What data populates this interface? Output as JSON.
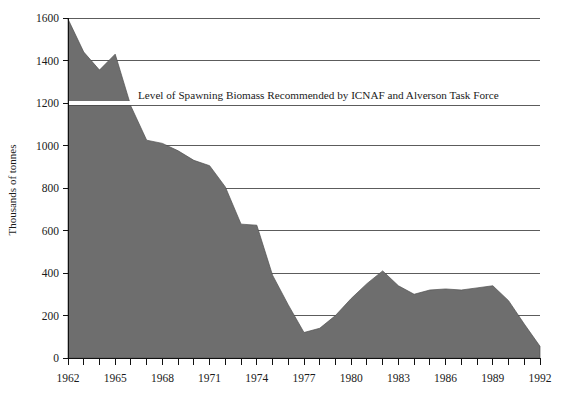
{
  "chart_data": {
    "type": "area",
    "title": "",
    "subtitle": "",
    "xlabel": "",
    "ylabel": "Thousands of tonnes",
    "xlim": [
      1962,
      1992
    ],
    "ylim": [
      0,
      1600
    ],
    "grid": true,
    "legend_position": "none",
    "series_name": "Spawning biomass",
    "x_tick_labels": [
      "1962",
      "1965",
      "1968",
      "1971",
      "1974",
      "1977",
      "1980",
      "1983",
      "1986",
      "1989",
      "1992"
    ],
    "x_tick_values": [
      1962,
      1965,
      1968,
      1971,
      1974,
      1977,
      1980,
      1983,
      1986,
      1989,
      1992
    ],
    "x_minor_ticks_every": 1,
    "y_tick_labels": [
      "0",
      "200",
      "400",
      "600",
      "800",
      "1000",
      "1200",
      "1400",
      "1600"
    ],
    "y_tick_values": [
      0,
      200,
      400,
      600,
      800,
      1000,
      1200,
      1400,
      1600
    ],
    "x": [
      1962,
      1963,
      1964,
      1965,
      1966,
      1967,
      1968,
      1969,
      1970,
      1971,
      1972,
      1973,
      1974,
      1975,
      1976,
      1977,
      1978,
      1979,
      1980,
      1981,
      1982,
      1983,
      1984,
      1985,
      1986,
      1987,
      1988,
      1989,
      1990,
      1991,
      1992
    ],
    "values": [
      1595,
      1440,
      1355,
      1430,
      1185,
      1025,
      1010,
      975,
      930,
      905,
      805,
      630,
      625,
      390,
      250,
      120,
      140,
      200,
      280,
      350,
      410,
      340,
      300,
      320,
      325,
      320,
      330,
      340,
      270,
      160,
      55
    ],
    "annotations": [
      {
        "text": "Level of Spawning Biomass Recommended by ICNAF and Alverson Task Force",
        "y_value": 1200,
        "style": "horizontal reference line"
      }
    ],
    "colors": {
      "area_fill": "#6e6e6e",
      "grid": "#4a4a4a",
      "axis": "#111111",
      "reference_line_highlight": "#ffffff",
      "text": "#1a1a1a",
      "background": "#ffffff"
    }
  }
}
